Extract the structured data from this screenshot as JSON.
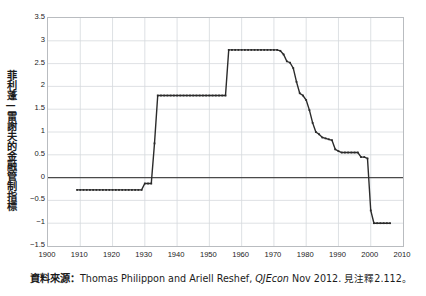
{
  "figure": {
    "ylabel": "菲利蓬—雷謝夫的金融管制指標",
    "caption_lead": "資料來源：",
    "caption_authors": "Thomas Philippon and Ariell Reshef, ",
    "caption_journal": "QJEcon",
    "caption_tail": " Nov 2012. 見注釋2.112。"
  },
  "chart_data": {
    "type": "line",
    "title": "",
    "xlabel": "",
    "ylabel": "菲利蓬—雷謝夫的金融管制指標",
    "xlim": [
      1900,
      2010
    ],
    "ylim": [
      -1.5,
      3.5
    ],
    "xticks": [
      1900,
      1910,
      1920,
      1930,
      1940,
      1950,
      1960,
      1970,
      1980,
      1990,
      2000,
      2010
    ],
    "yticks": [
      -1.5,
      -1,
      -0.5,
      0,
      0.5,
      1,
      1.5,
      2,
      2.5,
      3,
      3.5
    ],
    "grid": true,
    "legend": "none",
    "zero_line": 0,
    "line_color": "#2b2b2b",
    "grid_color": "#d6d9dd",
    "frame_color": "#b9bcc0",
    "series": [
      {
        "name": "Philippon-Reshef financial regulation index",
        "x": [
          1909,
          1910,
          1911,
          1912,
          1913,
          1914,
          1915,
          1916,
          1917,
          1918,
          1919,
          1920,
          1921,
          1922,
          1923,
          1924,
          1925,
          1926,
          1927,
          1928,
          1929,
          1930,
          1931,
          1932,
          1933,
          1934,
          1935,
          1936,
          1937,
          1938,
          1939,
          1940,
          1941,
          1942,
          1943,
          1944,
          1945,
          1946,
          1947,
          1948,
          1949,
          1950,
          1951,
          1952,
          1953,
          1954,
          1955,
          1956,
          1957,
          1958,
          1959,
          1960,
          1961,
          1962,
          1963,
          1964,
          1965,
          1966,
          1967,
          1968,
          1969,
          1970,
          1971,
          1972,
          1973,
          1974,
          1975,
          1976,
          1977,
          1978,
          1979,
          1980,
          1981,
          1982,
          1983,
          1984,
          1985,
          1986,
          1987,
          1988,
          1989,
          1990,
          1991,
          1992,
          1993,
          1994,
          1995,
          1996,
          1997,
          1998,
          1999,
          2000,
          2001,
          2002,
          2003,
          2004,
          2005,
          2006
        ],
        "y": [
          -0.27,
          -0.27,
          -0.27,
          -0.27,
          -0.27,
          -0.27,
          -0.27,
          -0.27,
          -0.27,
          -0.27,
          -0.27,
          -0.27,
          -0.27,
          -0.27,
          -0.27,
          -0.27,
          -0.27,
          -0.27,
          -0.27,
          -0.27,
          -0.27,
          -0.13,
          -0.13,
          -0.13,
          0.75,
          1.8,
          1.8,
          1.8,
          1.8,
          1.8,
          1.8,
          1.8,
          1.8,
          1.8,
          1.8,
          1.8,
          1.8,
          1.8,
          1.8,
          1.8,
          1.8,
          1.8,
          1.8,
          1.8,
          1.8,
          1.8,
          1.8,
          2.8,
          2.8,
          2.8,
          2.8,
          2.8,
          2.8,
          2.8,
          2.8,
          2.8,
          2.8,
          2.8,
          2.8,
          2.8,
          2.8,
          2.8,
          2.8,
          2.78,
          2.7,
          2.55,
          2.52,
          2.4,
          2.1,
          1.85,
          1.8,
          1.7,
          1.48,
          1.2,
          1.0,
          0.95,
          0.88,
          0.86,
          0.84,
          0.82,
          0.62,
          0.58,
          0.55,
          0.55,
          0.55,
          0.55,
          0.55,
          0.55,
          0.45,
          0.45,
          0.42,
          -0.72,
          -1.0,
          -1.0,
          -1.0,
          -1.0,
          -1.0,
          -1.0
        ]
      }
    ]
  },
  "axis": {
    "ytick_labels": [
      "3.5",
      "3",
      "2.5",
      "2",
      "1.5",
      "1",
      "0.5",
      "0",
      "−0.5",
      "−1",
      "−1.5"
    ],
    "xtick_labels": [
      "1900",
      "1910",
      "1920",
      "1930",
      "1940",
      "1950",
      "1960",
      "1970",
      "1980",
      "1990",
      "2000",
      "2010"
    ]
  }
}
